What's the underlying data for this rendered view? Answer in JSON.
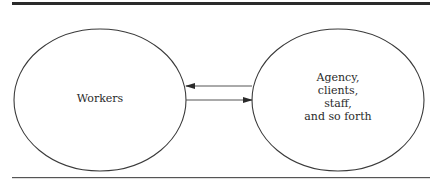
{
  "diagram": {
    "left_node": {
      "label": "Workers"
    },
    "right_node": {
      "lines": [
        "Agency,",
        "clients,",
        "staff,",
        "and so forth"
      ]
    },
    "arrows": [
      {
        "from": "right_node",
        "to": "left_node",
        "direction": "left"
      },
      {
        "from": "left_node",
        "to": "right_node",
        "direction": "right"
      }
    ]
  },
  "colors": {
    "stroke": "#3a3a3a",
    "rule": "#2a2a2a",
    "background": "#ffffff"
  }
}
